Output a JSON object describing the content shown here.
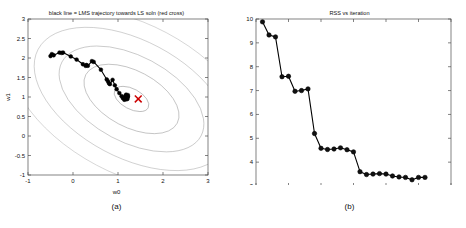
{
  "figure": {
    "panels": [
      {
        "id": "a",
        "caption": "(a)",
        "title": "black line = LMS trajectory towards LS soln (red cross)",
        "chart_data": {
          "type": "line",
          "title": "black line = LMS trajectory towards LS soln (red cross)",
          "xlabel": "w0",
          "ylabel": "w1",
          "xlim": [
            -1,
            3
          ],
          "ylim": [
            -1,
            3
          ],
          "xticks": [
            -1,
            0,
            1,
            2,
            3
          ],
          "xticklabels": [
            "-1",
            "0",
            "1",
            "2",
            "3"
          ],
          "yticks": [
            -1,
            -0.5,
            0,
            0.5,
            1,
            1.5,
            2,
            2.5,
            3
          ],
          "yticklabels": [
            "-1",
            "-0.5",
            "0",
            "0.5",
            "1",
            "1.5",
            "2",
            "2.5",
            "3"
          ],
          "grid": false,
          "legend": "none",
          "series": [
            {
              "name": "LMS trajectory",
              "marker": "filled-circle",
              "color": "#000000",
              "x": [
                -0.5,
                -0.47,
                -0.43,
                -0.3,
                -0.25,
                -0.22,
                -0.05,
                0.08,
                0.22,
                0.28,
                0.3,
                0.33,
                0.42,
                0.46,
                0.62,
                0.75,
                0.78,
                0.8,
                0.82,
                0.88,
                0.93,
                0.97,
                1.03,
                1.08,
                1.11,
                1.14,
                1.16,
                1.18,
                1.19,
                1.2,
                1.21,
                1.22,
                1.18,
                1.15,
                1.19,
                1.22,
                1.2,
                1.18,
                1.21
              ],
              "y": [
                2.05,
                2.1,
                2.07,
                2.14,
                2.13,
                2.14,
                2.04,
                1.96,
                1.84,
                1.8,
                1.82,
                1.8,
                1.92,
                1.9,
                1.7,
                1.45,
                1.4,
                1.35,
                1.33,
                1.44,
                1.3,
                1.2,
                1.1,
                1.02,
                0.97,
                0.93,
                1.02,
                1.06,
                1.02,
                0.98,
                0.95,
                1.05,
                1.03,
                0.98,
                0.99,
                1.01,
                0.97,
                0.94,
                1.0
              ]
            }
          ],
          "markers": [
            {
              "name": "LS solution",
              "symbol": "x",
              "color": "#cc0000",
              "x": 1.45,
              "y": 0.95
            }
          ],
          "contours": {
            "description": "elliptical RSS cost contours centered near LS solution",
            "color": "#999999",
            "center": [
              1.3,
              0.95
            ],
            "rotation_deg": -28,
            "levels": [
              {
                "rx": 0.42,
                "ry": 0.26
              },
              {
                "rx": 1.15,
                "ry": 0.72
              },
              {
                "rx": 1.75,
                "ry": 1.1
              },
              {
                "rx": 2.35,
                "ry": 1.5
              },
              {
                "rx": 2.95,
                "ry": 1.92
              }
            ]
          }
        }
      },
      {
        "id": "b",
        "caption": "(b)",
        "title": "RSS vs iteration",
        "chart_data": {
          "type": "line",
          "title": "RSS vs iteration",
          "xlabel": "",
          "ylabel": "",
          "xlim": [
            0,
            30
          ],
          "ylim": [
            3,
            10
          ],
          "xticks": [
            0,
            5,
            10,
            15,
            20,
            25,
            30
          ],
          "xticklabels": [
            "0",
            "5",
            "10",
            "15",
            "20",
            "25",
            "30"
          ],
          "yticks": [
            3,
            4,
            5,
            6,
            7,
            8,
            9,
            10
          ],
          "yticklabels": [
            "3",
            "4",
            "5",
            "6",
            "7",
            "8",
            "9",
            "10"
          ],
          "grid": false,
          "legend": "none",
          "series": [
            {
              "name": "RSS",
              "marker": "filled-circle",
              "color": "#000000",
              "x": [
                1,
                2,
                3,
                4,
                5,
                6,
                7,
                8,
                9,
                10,
                11,
                12,
                13,
                14,
                15,
                16,
                17,
                18,
                19,
                20,
                21,
                22,
                23,
                24,
                25,
                26
              ],
              "y": [
                9.88,
                9.33,
                9.25,
                7.58,
                7.6,
                6.97,
                7.0,
                7.07,
                5.2,
                4.58,
                4.53,
                4.55,
                4.6,
                4.52,
                4.43,
                3.6,
                3.48,
                3.5,
                3.52,
                3.5,
                3.42,
                3.38,
                3.36,
                3.26,
                3.36,
                3.36
              ]
            }
          ]
        }
      }
    ]
  }
}
